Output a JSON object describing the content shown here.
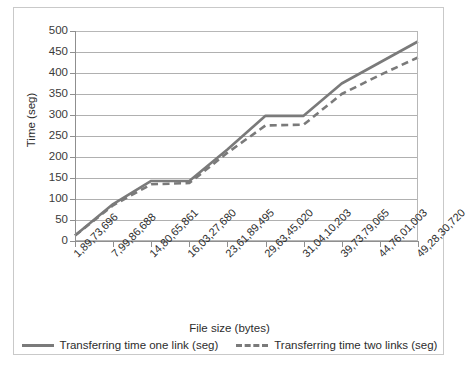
{
  "chart_data": {
    "type": "line",
    "title": "",
    "xlabel": "File size (bytes)",
    "ylabel": "Time (seg)",
    "ylim": [
      0,
      500
    ],
    "ytick_step": 50,
    "yticks": [
      0,
      50,
      100,
      150,
      200,
      250,
      300,
      350,
      400,
      450,
      500
    ],
    "ytick_labels": [
      "0",
      "50",
      "100",
      "150",
      "200",
      "250",
      "300",
      "350",
      "400",
      "450",
      "500"
    ],
    "grid": true,
    "grid_axis": "y",
    "legend_position": "bottom",
    "categories": [
      "1,89,73,696",
      "7,99,86,688",
      "14,80,65,861",
      "16,03,27,680",
      "23,61,89,495",
      "29,63,45,020",
      "31,04,10,203",
      "39,73,79,065",
      "44,76,01,003",
      "49,28,30,720"
    ],
    "series": [
      {
        "name": "Transferring time one link (seg)",
        "style": "solid",
        "color": "#7a7a7a",
        "values": [
          13,
          88,
          143,
          143,
          218,
          298,
          298,
          375,
          425,
          475
        ]
      },
      {
        "name": "Transferring time two links (seg)",
        "style": "dashed",
        "color": "#7a7a7a",
        "values": [
          13,
          85,
          135,
          138,
          210,
          275,
          277,
          350,
          395,
          437
        ]
      }
    ]
  },
  "legend": {
    "items": [
      {
        "label": "Transferring time one link (seg)",
        "style": "solid"
      },
      {
        "label": "Transferring time two links (seg)",
        "style": "dashed"
      }
    ]
  },
  "axes": {
    "x_title": "File size (bytes)",
    "y_title": "Time (seg)"
  }
}
